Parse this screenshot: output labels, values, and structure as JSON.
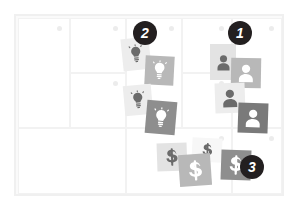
{
  "board": {
    "name": "idea-board",
    "background_color": "#fafafa",
    "border_color": "#f0f0f0",
    "cell_color": "#ffffff",
    "cell_border_color": "#f2f2f2",
    "cell_dot_color": "#ececec",
    "columns": 5,
    "cells": [
      {
        "id": "cell-r1c1",
        "x": 2,
        "y": 2,
        "w": 52,
        "h": 110,
        "dot": true
      },
      {
        "id": "cell-r1c2",
        "x": 54,
        "y": 2,
        "w": 56,
        "h": 55,
        "dot": true
      },
      {
        "id": "cell-r1c3",
        "x": 110,
        "y": 2,
        "w": 56,
        "h": 110,
        "dot": true
      },
      {
        "id": "cell-r1c4",
        "x": 166,
        "y": 2,
        "w": 50,
        "h": 55,
        "dot": true
      },
      {
        "id": "cell-r1c5",
        "x": 216,
        "y": 2,
        "w": 50,
        "h": 110,
        "dot": true
      },
      {
        "id": "cell-r2c2",
        "x": 54,
        "y": 57,
        "w": 56,
        "h": 55,
        "dot": true
      },
      {
        "id": "cell-r2c4",
        "x": 166,
        "y": 57,
        "w": 50,
        "h": 55,
        "dot": true
      },
      {
        "id": "cell-r3c1",
        "x": 2,
        "y": 112,
        "w": 108,
        "h": 66,
        "dot": false
      },
      {
        "id": "cell-r3c2",
        "x": 110,
        "y": 112,
        "w": 106,
        "h": 66,
        "dot": true
      },
      {
        "id": "cell-r3c3",
        "x": 216,
        "y": 112,
        "w": 50,
        "h": 66,
        "dot": true
      }
    ]
  },
  "clusters": [
    {
      "id": "cluster-people",
      "label": "1",
      "icon": "person-icon",
      "badge": {
        "x": 228,
        "y": 21,
        "size": 24,
        "font_size": 14,
        "color": "#231f20",
        "text_color": "#ffffff"
      },
      "cards": [
        {
          "name": "person-card-1",
          "x": 210,
          "y": 44,
          "w": 26,
          "h": 36,
          "rot": 0,
          "tone": "t-light",
          "ink": "ink-dark",
          "icon": "person-icon"
        },
        {
          "name": "person-card-2",
          "x": 231,
          "y": 58,
          "w": 30,
          "h": 30,
          "rot": 1,
          "tone": "t-mid",
          "ink": "ink-light",
          "icon": "person-icon"
        },
        {
          "name": "person-card-3",
          "x": 215,
          "y": 83,
          "w": 30,
          "h": 30,
          "rot": -2,
          "tone": "t-pale",
          "ink": "ink-dark",
          "icon": "person-icon"
        },
        {
          "name": "person-card-4",
          "x": 238,
          "y": 103,
          "w": 30,
          "h": 30,
          "rot": 2,
          "tone": "t-darker",
          "ink": "ink-light",
          "icon": "person-icon"
        }
      ]
    },
    {
      "id": "cluster-ideas",
      "label": "2",
      "icon": "lightbulb-icon",
      "badge": {
        "x": 133,
        "y": 21,
        "size": 24,
        "font_size": 14,
        "color": "#231f20",
        "text_color": "#ffffff"
      },
      "cards": [
        {
          "name": "idea-card-1",
          "x": 122,
          "y": 38,
          "w": 28,
          "h": 32,
          "rot": -6,
          "tone": "t-pale",
          "ink": "ink-dark",
          "icon": "lightbulb-icon"
        },
        {
          "name": "idea-card-2",
          "x": 145,
          "y": 56,
          "w": 29,
          "h": 29,
          "rot": 3,
          "tone": "t-mid",
          "ink": "ink-light",
          "icon": "lightbulb-icon"
        },
        {
          "name": "idea-card-3",
          "x": 124,
          "y": 85,
          "w": 28,
          "h": 30,
          "rot": -5,
          "tone": "t-pale",
          "ink": "ink-dark",
          "icon": "lightbulb-icon"
        },
        {
          "name": "idea-card-4",
          "x": 146,
          "y": 101,
          "w": 30,
          "h": 33,
          "rot": 5,
          "tone": "t-dark",
          "ink": "ink-light",
          "icon": "lightbulb-icon"
        }
      ]
    },
    {
      "id": "cluster-money",
      "label": "3",
      "icon": "dollar-icon",
      "badge": {
        "x": 240,
        "y": 155,
        "size": 24,
        "font_size": 14,
        "color": "#231f20",
        "text_color": "#ffffff"
      },
      "cards": [
        {
          "name": "money-card-1",
          "x": 157,
          "y": 143,
          "w": 30,
          "h": 28,
          "rot": -2,
          "tone": "t-light",
          "ink": "ink-dark",
          "icon": "dollar-icon"
        },
        {
          "name": "money-card-2",
          "x": 192,
          "y": 138,
          "w": 30,
          "h": 24,
          "rot": 3,
          "tone": "t-white",
          "ink": "ink-dark",
          "icon": "dollar-icon"
        },
        {
          "name": "money-card-3",
          "x": 179,
          "y": 154,
          "w": 32,
          "h": 32,
          "rot": -4,
          "tone": "t-mid",
          "ink": "ink-light",
          "icon": "dollar-icon"
        },
        {
          "name": "money-card-4",
          "x": 221,
          "y": 150,
          "w": 30,
          "h": 30,
          "rot": 2,
          "tone": "t-dark",
          "ink": "ink-light",
          "icon": "dollar-icon"
        }
      ]
    }
  ]
}
